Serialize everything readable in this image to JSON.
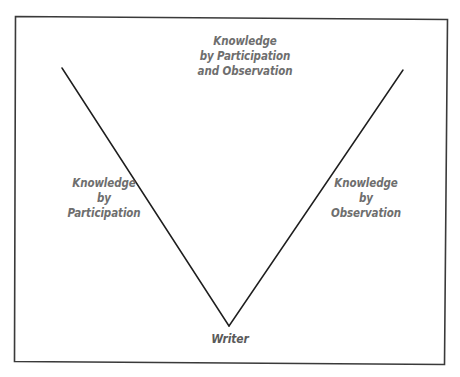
{
  "diagram": {
    "type": "v-diagram",
    "frame_color": "#3a3a3a",
    "line_color": "#1e1e1e",
    "text_color": "#6e6e6e",
    "labels": {
      "top": {
        "line1": "Knowledge",
        "line2": "by Participation",
        "line3": "and Observation"
      },
      "left": {
        "line1": "Knowledge",
        "line2": "by",
        "line3": "Participation"
      },
      "right": {
        "line1": "Knowledge",
        "line2": "by",
        "line3": "Observation"
      },
      "bottom": {
        "line1": "Writer"
      }
    }
  }
}
